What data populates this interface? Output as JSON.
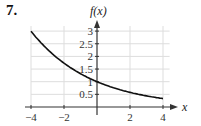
{
  "problem_number": "7.",
  "chart_data": {
    "type": "line",
    "title": "",
    "xlabel": "x",
    "ylabel": "f(x)",
    "x_ticks": [
      "-4",
      "-2",
      "2",
      "4"
    ],
    "y_ticks": [
      "0.5",
      "1",
      "1.5",
      "2",
      "2.5",
      "3"
    ],
    "xlim": [
      -4,
      4
    ],
    "ylim": [
      0,
      3.2
    ],
    "grid": true,
    "series": [
      {
        "name": "f(x)",
        "x": [
          -4,
          -3,
          -2,
          -1,
          0,
          1,
          2,
          3,
          4
        ],
        "values": [
          3.0,
          2.3,
          1.75,
          1.32,
          1.0,
          0.76,
          0.58,
          0.44,
          0.34
        ]
      }
    ]
  }
}
